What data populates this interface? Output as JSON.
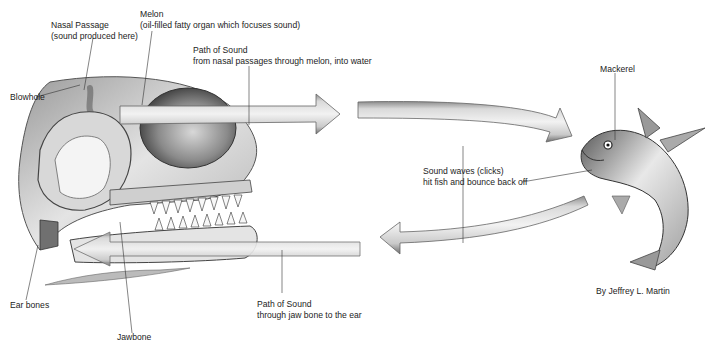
{
  "diagram": {
    "colors": {
      "background": "#ffffff",
      "ink": "#1c1c1c",
      "arrow_fill": "#e6e6e6",
      "arrow_edge": "#6a6a6a",
      "shade": "#8a8a8a"
    },
    "labels": {
      "nasal_passage": {
        "line1": "Nasal Passage",
        "line2": "(sound produced here)"
      },
      "melon": {
        "line1": "Melon",
        "line2": "(oil-filled fatty organ which focuses sound)"
      },
      "path_out": {
        "line1": "Path of Sound",
        "line2": "from nasal passages through melon, into water"
      },
      "blowhole": {
        "line1": "Blowhole"
      },
      "mackerel": {
        "line1": "Mackerel"
      },
      "sound_waves": {
        "line1": "Sound waves (clicks)",
        "line2": "hit fish and bounce back off"
      },
      "ear_bones": {
        "line1": "Ear bones"
      },
      "jawbone": {
        "line1": "Jawbone"
      },
      "path_in": {
        "line1": "Path of Sound",
        "line2": "through jaw bone to the ear"
      },
      "credit": {
        "line1": "By Jeffrey L. Martin"
      }
    },
    "arrows": [
      {
        "name": "outgoing-arrow-1",
        "direction": "right",
        "from": "melon",
        "to": "water"
      },
      {
        "name": "outgoing-arrow-2",
        "direction": "right-down",
        "from": "water",
        "to": "mackerel"
      },
      {
        "name": "return-arrow-1",
        "direction": "left",
        "from": "mackerel",
        "to": "water"
      },
      {
        "name": "return-arrow-2",
        "direction": "left",
        "from": "water",
        "to": "jawbone"
      }
    ]
  }
}
